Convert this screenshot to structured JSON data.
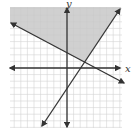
{
  "diagram": {
    "type": "coordinate-plane-inequality-graph",
    "axes": {
      "x_label": "x",
      "y_label": "y"
    },
    "colors": {
      "shade": "#c8c8c8",
      "grid": "#d4d4d4",
      "axis": "#333333",
      "line": "#333333",
      "background": "#ffffff"
    },
    "grid": {
      "cell_px": 6.6,
      "left_px": 10,
      "top_px": 7,
      "right_px": 122,
      "bottom_px": 128,
      "origin_px": [
        67,
        68
      ]
    },
    "lines": [
      {
        "name": "decreasing-boundary-line",
        "from_px": [
          11,
          23
        ],
        "to_px": [
          124,
          83
        ]
      },
      {
        "name": "increasing-boundary-line",
        "from_px": [
          42,
          126
        ],
        "to_px": [
          120,
          9
        ]
      }
    ],
    "shaded_region": "above the decreasing line and left of the increasing line"
  }
}
